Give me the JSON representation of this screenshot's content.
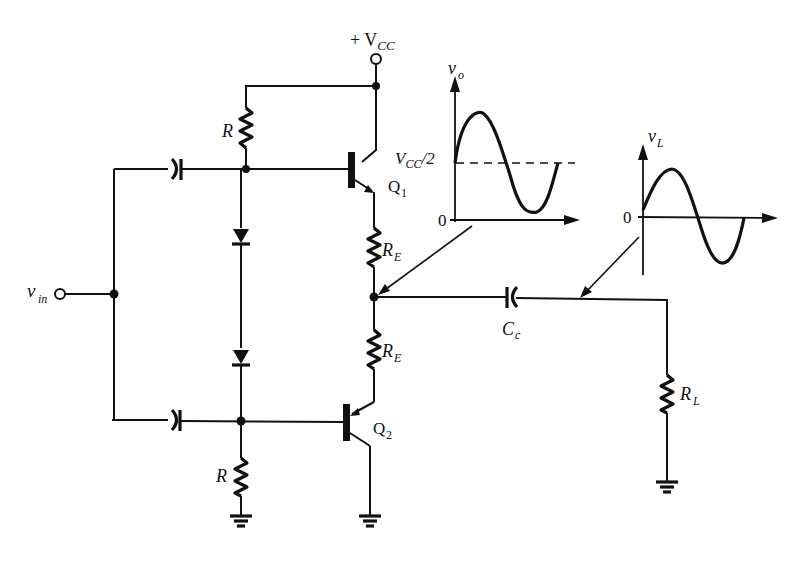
{
  "colors": {
    "ink": "#111111",
    "background": "#ffffff"
  },
  "labels": {
    "vcc": "+ V",
    "vcc_sub": "CC",
    "vin": "v",
    "vin_sub": "in",
    "r_top": "R",
    "r_bottom": "R",
    "re_top": "R",
    "re_top_sub": "E",
    "re_bottom": "R",
    "re_bottom_sub": "E",
    "q1": "Q",
    "q1_sub": "1",
    "q2": "Q",
    "q2_sub": "2",
    "cc": "C",
    "cc_sub": "c",
    "rl": "R",
    "rl_sub": "L"
  },
  "components": [
    {
      "id": "Q1",
      "type": "NPN transistor"
    },
    {
      "id": "Q2",
      "type": "PNP transistor"
    },
    {
      "id": "R_top",
      "type": "resistor",
      "label": "R"
    },
    {
      "id": "R_bottom",
      "type": "resistor",
      "label": "R"
    },
    {
      "id": "RE_top",
      "type": "resistor",
      "label": "R_E"
    },
    {
      "id": "RE_bottom",
      "type": "resistor",
      "label": "R_E"
    },
    {
      "id": "D1",
      "type": "diode"
    },
    {
      "id": "D2",
      "type": "diode"
    },
    {
      "id": "C_in_top",
      "type": "capacitor"
    },
    {
      "id": "C_in_bottom",
      "type": "capacitor"
    },
    {
      "id": "Cc",
      "type": "capacitor",
      "label": "C_c"
    },
    {
      "id": "RL",
      "type": "resistor",
      "label": "R_L"
    }
  ],
  "graphs": {
    "vo": {
      "ylabel": "v",
      "ylabel_sub": "o",
      "level_label": "V",
      "level_sub": "CC",
      "level_suffix": "/2",
      "zero": "0"
    },
    "vl": {
      "ylabel": "v",
      "ylabel_sub": "L",
      "zero": "0"
    }
  }
}
